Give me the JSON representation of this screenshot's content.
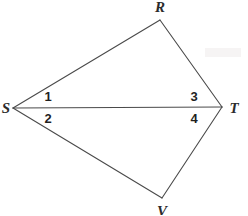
{
  "figure": {
    "type": "geometry-diagram",
    "background_color": "#ffffff",
    "stroke_color": "#4a4a4a",
    "stroke_width": 1,
    "canvas": {
      "width": 248,
      "height": 215
    },
    "vertices": [
      {
        "id": "R",
        "label": "R",
        "x": 160,
        "y": 20,
        "label_x": 160,
        "label_y": 7
      },
      {
        "id": "S",
        "label": "S",
        "x": 13,
        "y": 108,
        "label_x": 6,
        "label_y": 108
      },
      {
        "id": "T",
        "label": "T",
        "x": 222,
        "y": 107,
        "label_x": 234,
        "label_y": 108
      },
      {
        "id": "V",
        "label": "V",
        "x": 162,
        "y": 198,
        "label_x": 162,
        "label_y": 211
      }
    ],
    "edges": [
      {
        "id": "SR",
        "from": "S",
        "to": "R"
      },
      {
        "id": "RT",
        "from": "R",
        "to": "T"
      },
      {
        "id": "ST",
        "from": "S",
        "to": "T"
      },
      {
        "id": "SV",
        "from": "S",
        "to": "V"
      },
      {
        "id": "VT",
        "from": "V",
        "to": "T"
      }
    ],
    "angle_labels": [
      {
        "id": "angle-1",
        "label": "1",
        "x": 48,
        "y": 96,
        "at_vertex": "S",
        "between": "SR and ST"
      },
      {
        "id": "angle-2",
        "label": "2",
        "x": 48,
        "y": 118,
        "at_vertex": "S",
        "between": "ST and SV"
      },
      {
        "id": "angle-3",
        "label": "3",
        "x": 194,
        "y": 96,
        "at_vertex": "T",
        "between": "TR and TS"
      },
      {
        "id": "angle-4",
        "label": "4",
        "x": 194,
        "y": 118,
        "at_vertex": "T",
        "between": "TS and TV"
      }
    ]
  }
}
